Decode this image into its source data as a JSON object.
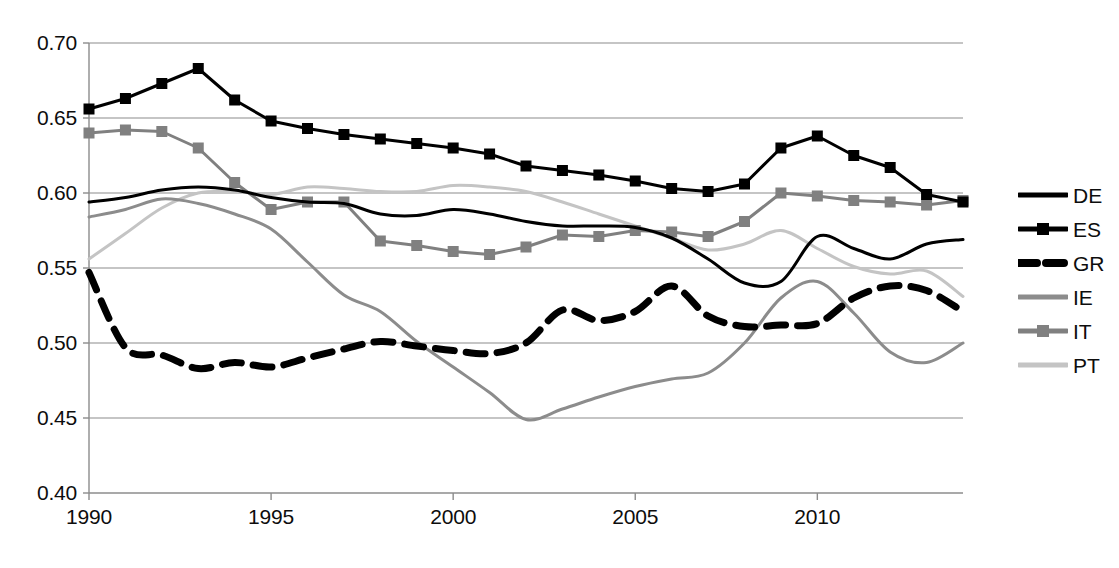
{
  "chart_data": {
    "type": "line",
    "title": "",
    "xlabel": "",
    "ylabel": "",
    "xlim": [
      1990,
      2014
    ],
    "ylim": [
      0.4,
      0.7
    ],
    "grid": true,
    "legend_position": "right",
    "y_ticks": [
      "0.40",
      "0.45",
      "0.50",
      "0.55",
      "0.60",
      "0.65",
      "0.70"
    ],
    "y_tick_values": [
      0.4,
      0.45,
      0.5,
      0.55,
      0.6,
      0.65,
      0.7
    ],
    "x_ticks": [
      "1990",
      "1995",
      "2000",
      "2005",
      "2010"
    ],
    "x_tick_values": [
      1990,
      1995,
      2000,
      2005,
      2010
    ],
    "x": [
      1990,
      1991,
      1992,
      1993,
      1994,
      1995,
      1996,
      1997,
      1998,
      1999,
      2000,
      2001,
      2002,
      2003,
      2004,
      2005,
      2006,
      2007,
      2008,
      2009,
      2010,
      2011,
      2012,
      2013,
      2014
    ],
    "series": [
      {
        "name": "DE",
        "style": "solid",
        "color": "#000000",
        "width": 3,
        "marker": "none",
        "values": [
          0.594,
          0.597,
          0.602,
          0.604,
          0.602,
          0.597,
          0.594,
          0.593,
          0.586,
          0.585,
          0.589,
          0.586,
          0.581,
          0.578,
          0.578,
          0.577,
          0.57,
          0.556,
          0.54,
          0.541,
          0.571,
          0.563,
          0.556,
          0.566,
          0.569
        ]
      },
      {
        "name": "ES",
        "style": "solid",
        "color": "#000000",
        "width": 3,
        "marker": "square",
        "values": [
          0.656,
          0.663,
          0.673,
          0.683,
          0.662,
          0.648,
          0.643,
          0.639,
          0.636,
          0.633,
          0.63,
          0.626,
          0.618,
          0.615,
          0.612,
          0.608,
          0.603,
          0.601,
          0.606,
          0.63,
          0.638,
          0.625,
          0.617,
          0.599,
          0.594
        ]
      },
      {
        "name": "GR",
        "style": "dashed",
        "color": "#000000",
        "width": 7,
        "marker": "none",
        "values": [
          0.547,
          0.497,
          0.492,
          0.483,
          0.487,
          0.484,
          0.49,
          0.496,
          0.501,
          0.498,
          0.495,
          0.493,
          0.5,
          0.522,
          0.515,
          0.521,
          0.538,
          0.518,
          0.511,
          0.512,
          0.513,
          0.53,
          0.538,
          0.535,
          0.521
        ]
      },
      {
        "name": "IE",
        "style": "solid",
        "color": "#8c8c8c",
        "width": 3,
        "marker": "none",
        "values": [
          0.584,
          0.589,
          0.596,
          0.593,
          0.586,
          0.576,
          0.554,
          0.532,
          0.521,
          0.501,
          0.484,
          0.467,
          0.449,
          0.456,
          0.464,
          0.471,
          0.476,
          0.48,
          0.5,
          0.53,
          0.541,
          0.52,
          0.494,
          0.487,
          0.5
        ]
      },
      {
        "name": "IT",
        "style": "solid",
        "color": "#808080",
        "width": 3,
        "marker": "square",
        "values": [
          0.64,
          0.642,
          0.641,
          0.63,
          0.607,
          0.589,
          0.594,
          0.594,
          0.568,
          0.565,
          0.561,
          0.559,
          0.564,
          0.572,
          0.571,
          0.575,
          0.574,
          0.571,
          0.581,
          0.6,
          0.598,
          0.595,
          0.594,
          0.592,
          0.595
        ]
      },
      {
        "name": "PT",
        "style": "solid",
        "color": "#c4c4c4",
        "width": 3,
        "marker": "none",
        "values": [
          0.556,
          0.573,
          0.59,
          0.6,
          0.601,
          0.599,
          0.604,
          0.603,
          0.601,
          0.601,
          0.605,
          0.604,
          0.601,
          0.594,
          0.586,
          0.578,
          0.57,
          0.562,
          0.566,
          0.575,
          0.563,
          0.551,
          0.546,
          0.548,
          0.531
        ]
      }
    ]
  },
  "legend": {
    "items": [
      {
        "label": "DE",
        "style": "solid",
        "color": "#000000",
        "marker": "none",
        "width": 5
      },
      {
        "label": "ES",
        "style": "solid",
        "color": "#000000",
        "marker": "square",
        "width": 5
      },
      {
        "label": "GR",
        "style": "dashed",
        "color": "#000000",
        "marker": "none",
        "width": 8
      },
      {
        "label": "IE",
        "style": "solid",
        "color": "#8c8c8c",
        "marker": "none",
        "width": 5
      },
      {
        "label": "IT",
        "style": "solid",
        "color": "#808080",
        "marker": "square",
        "width": 5
      },
      {
        "label": "PT",
        "style": "solid",
        "color": "#c4c4c4",
        "marker": "none",
        "width": 5
      }
    ]
  },
  "axes": {
    "gridline_color": "#8c8c8c",
    "axis_color": "#8c8c8c",
    "plot_left": 89,
    "plot_right": 963,
    "plot_top": 43,
    "plot_bottom": 493
  }
}
